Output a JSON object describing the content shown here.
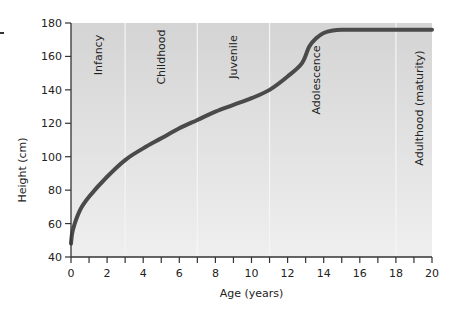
{
  "chart_data": {
    "type": "line",
    "title": "",
    "xlabel": "Age (years)",
    "ylabel": "Height (cm)",
    "xlim": [
      0,
      20
    ],
    "ylim": [
      40,
      180
    ],
    "x_ticks": [
      0,
      2,
      4,
      6,
      8,
      10,
      12,
      14,
      16,
      18,
      20
    ],
    "x_minor_ticks": [
      1,
      3,
      5,
      7,
      9,
      11,
      13,
      15,
      17,
      19
    ],
    "y_ticks": [
      40,
      60,
      80,
      100,
      120,
      140,
      160,
      180
    ],
    "grid": false,
    "legend": null,
    "stages": [
      {
        "label": "Infancy",
        "start": 0,
        "end": 3
      },
      {
        "label": "Childhood",
        "start": 3,
        "end": 7
      },
      {
        "label": "Juvenile",
        "start": 7,
        "end": 11
      },
      {
        "label": "Adolescence",
        "start": 11,
        "end": 18
      },
      {
        "label": "Adulthood (maturity)",
        "start": 18,
        "end": 20
      }
    ],
    "stage_boundaries": [
      3,
      7,
      11,
      18
    ],
    "series": [
      {
        "name": "Height",
        "x": [
          0,
          0.1,
          0.5,
          1,
          2,
          3,
          4,
          5,
          6,
          7,
          8,
          9,
          10,
          11,
          12,
          12.8,
          13.2,
          13.6,
          14,
          14.5,
          15,
          16,
          18,
          20
        ],
        "values": [
          48,
          56,
          68,
          76,
          88,
          98,
          105,
          111,
          117,
          122,
          127,
          131,
          135,
          140,
          148,
          156,
          166,
          171,
          174,
          175.5,
          176,
          176,
          176,
          176
        ]
      }
    ],
    "colors": {
      "curve": "#4a4a4a",
      "background": "#d9d9d9",
      "divider": "#f5f5f5"
    }
  }
}
